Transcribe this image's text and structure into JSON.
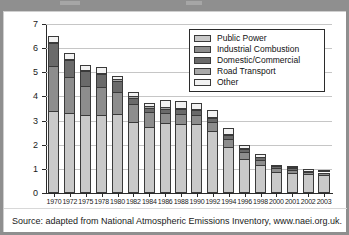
{
  "caption": "Source: adapted from National Atmospheric Emissions Inventory, www.naei.org.uk.",
  "axis": {
    "y_title_main": "SO",
    "y_title_sub": "2",
    "y_title_rest": " emissions (Mt)",
    "y_ticks": [
      "0",
      "1",
      "2",
      "3",
      "4",
      "5",
      "6",
      "7"
    ]
  },
  "legend": {
    "items": [
      {
        "label": "Public Power",
        "color": "#c9c9c9"
      },
      {
        "label": "Industrial Combustion",
        "color": "#8d8d8d"
      },
      {
        "label": "Domestic/Commercial",
        "color": "#6a6a6a"
      },
      {
        "label": "Road Transport",
        "color": "#a8a8a8"
      },
      {
        "label": "Other",
        "color": "#f2f2f2"
      }
    ]
  },
  "chart_data": {
    "type": "bar",
    "stacked": true,
    "title": "",
    "xlabel": "",
    "ylabel": "SO2 emissions (Mt)",
    "ylim": [
      0,
      7
    ],
    "ytick_step": 1,
    "grid": true,
    "legend_position": "top-right-inside",
    "categories": [
      "1970",
      "1972",
      "1975",
      "1978",
      "1980",
      "1982",
      "1984",
      "1986",
      "1988",
      "1990",
      "1992",
      "1994",
      "1996",
      "1998",
      "2000",
      "2001",
      "2002",
      "2003"
    ],
    "series": [
      {
        "name": "Public Power",
        "color": "#c9c9c9",
        "values": [
          3.4,
          3.3,
          3.22,
          3.22,
          3.27,
          2.95,
          2.72,
          2.88,
          2.86,
          2.85,
          2.55,
          1.9,
          1.42,
          1.18,
          0.88,
          0.83,
          0.78,
          0.75
        ]
      },
      {
        "name": "Industrial Combustion",
        "color": "#8d8d8d",
        "values": [
          1.85,
          1.52,
          1.22,
          1.18,
          0.93,
          0.72,
          0.62,
          0.42,
          0.4,
          0.4,
          0.38,
          0.35,
          0.28,
          0.2,
          0.14,
          0.13,
          0.09,
          0.1
        ]
      },
      {
        "name": "Domestic/Commercial",
        "color": "#6a6a6a",
        "values": [
          0.95,
          0.68,
          0.6,
          0.52,
          0.45,
          0.28,
          0.2,
          0.2,
          0.2,
          0.18,
          0.18,
          0.16,
          0.12,
          0.1,
          0.08,
          0.08,
          0.05,
          0.05
        ]
      },
      {
        "name": "Road Transport",
        "color": "#a8a8a8",
        "values": [
          0.06,
          0.06,
          0.06,
          0.06,
          0.06,
          0.05,
          0.05,
          0.05,
          0.05,
          0.05,
          0.05,
          0.04,
          0.04,
          0.03,
          0.02,
          0.02,
          0.01,
          0.01
        ]
      },
      {
        "name": "Other",
        "color": "#f2f2f2",
        "values": [
          0.24,
          0.26,
          0.2,
          0.22,
          0.14,
          0.2,
          0.13,
          0.3,
          0.3,
          0.25,
          0.28,
          0.24,
          0.14,
          0.09,
          0.03,
          0.04,
          0.02,
          0.04
        ]
      }
    ],
    "totals": [
      6.5,
      5.82,
      5.3,
      5.2,
      4.85,
      4.2,
      3.72,
      3.85,
      3.81,
      3.73,
      3.44,
      2.69,
      2.0,
      1.6,
      1.15,
      1.1,
      0.95,
      0.95
    ]
  }
}
